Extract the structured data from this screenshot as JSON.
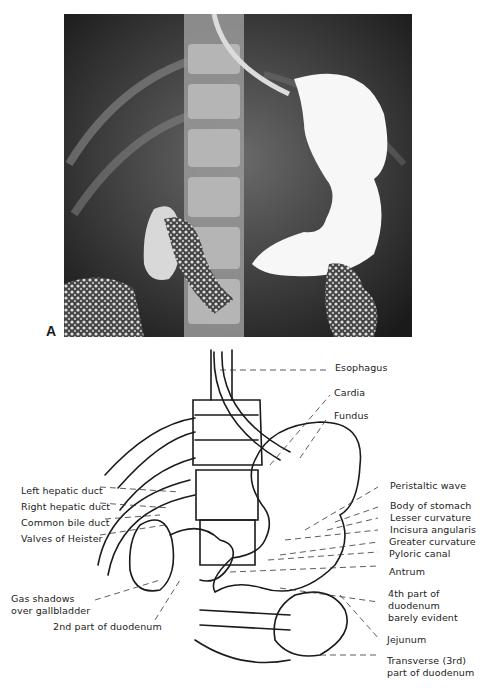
{
  "figure": {
    "panel_label": "A",
    "image_description": "Barium upper GI radiograph (frontal view) showing esophagus, stomach, duodenum and jejunum",
    "colors": {
      "background": "#ffffff",
      "xray_dark": "#2a2a2a",
      "barium": "#f5f5f5",
      "line": "#1a1a1a"
    }
  },
  "diagram": {
    "labels_left": [
      {
        "id": "left-hepatic-duct",
        "text": "Left hepatic duct"
      },
      {
        "id": "right-hepatic-duct",
        "text": "Right hepatic duct"
      },
      {
        "id": "common-bile-duct",
        "text": "Common bile duct"
      },
      {
        "id": "valves-of-heister",
        "text": "Valves of Heister"
      },
      {
        "id": "gas-shadows-1",
        "text": "Gas shadows"
      },
      {
        "id": "gas-shadows-2",
        "text": "over gallbladder"
      },
      {
        "id": "second-part-duodenum",
        "text": "2nd part of duodenum"
      }
    ],
    "labels_right": [
      {
        "id": "esophagus",
        "text": "Esophagus"
      },
      {
        "id": "cardia",
        "text": "Cardia"
      },
      {
        "id": "fundus",
        "text": "Fundus"
      },
      {
        "id": "peristaltic-wave",
        "text": "Peristaltic wave"
      },
      {
        "id": "body-of-stomach",
        "text": "Body of stomach"
      },
      {
        "id": "lesser-curvature",
        "text": "Lesser curvature"
      },
      {
        "id": "incisura-angularis",
        "text": "Incisura angularis"
      },
      {
        "id": "greater-curvature",
        "text": "Greater curvature"
      },
      {
        "id": "pyloric-canal",
        "text": "Pyloric canal"
      },
      {
        "id": "antrum",
        "text": "Antrum"
      },
      {
        "id": "fourth-part-1",
        "text": "4th part of"
      },
      {
        "id": "fourth-part-2",
        "text": "duodenum"
      },
      {
        "id": "fourth-part-3",
        "text": "barely evident"
      },
      {
        "id": "jejunum",
        "text": "Jejunum"
      },
      {
        "id": "transverse-1",
        "text": "Transverse (3rd)"
      },
      {
        "id": "transverse-2",
        "text": "part of duodenum"
      }
    ]
  }
}
